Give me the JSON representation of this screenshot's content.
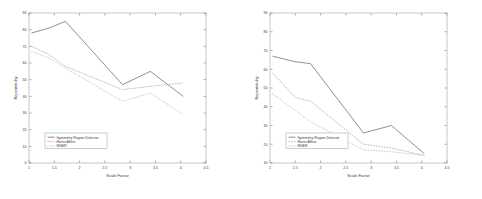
{
  "figure": {
    "background": "#ffffff",
    "panel_count": 2
  },
  "chart_data": [
    {
      "id": "left",
      "type": "line",
      "title": "",
      "xlabel": "Scale Factor",
      "ylabel": "Repeatability",
      "xlim": [
        1,
        4.5
      ],
      "ylim": [
        0,
        90
      ],
      "xticks": [
        1,
        1.5,
        2,
        2.5,
        3,
        3.5,
        4,
        4.5
      ],
      "xtick_labels": [
        "1",
        "1.5",
        "2",
        "2.5",
        "3",
        "3.5",
        "4",
        "4.5"
      ],
      "yticks": [
        0,
        10,
        20,
        30,
        40,
        50,
        60,
        70,
        80,
        90
      ],
      "ytick_labels": [
        "0",
        "10",
        "20",
        "30",
        "40",
        "50",
        "60",
        "70",
        "80",
        "90"
      ],
      "grid": false,
      "legend_position": "lower-left",
      "x": [
        1.05,
        1.4,
        1.72,
        2.85,
        3.4,
        4.05
      ],
      "series": [
        {
          "name": "Symmetry Region Detector",
          "style": "solid",
          "values": [
            78,
            81,
            85,
            47,
            55,
            40
          ]
        },
        {
          "name": "Harris Affine",
          "style": "dashed",
          "values": [
            70,
            65,
            58,
            44,
            46,
            48
          ]
        },
        {
          "name": "MSER",
          "style": "dotted",
          "values": [
            67,
            63,
            57,
            37,
            42,
            29
          ]
        }
      ]
    },
    {
      "id": "right",
      "type": "line",
      "title": "",
      "xlabel": "Scale Factor",
      "ylabel": "Repeatability",
      "xlim": [
        1,
        4.5
      ],
      "ylim": [
        10,
        90
      ],
      "xticks": [
        1,
        1.5,
        2,
        2.5,
        3,
        3.5,
        4,
        4.5
      ],
      "xtick_labels": [
        "1",
        "1.5",
        "2",
        "2.5",
        "3",
        "3.5",
        "4",
        "4.5"
      ],
      "yticks": [
        10,
        20,
        30,
        40,
        50,
        60,
        70,
        80,
        90
      ],
      "ytick_labels": [
        "10",
        "20",
        "30",
        "40",
        "50",
        "60",
        "70",
        "80",
        "90"
      ],
      "grid": false,
      "legend_position": "lower-left",
      "x": [
        1.05,
        1.5,
        1.8,
        2.85,
        3.4,
        4.05
      ],
      "series": [
        {
          "name": "Symmetry Region Detector",
          "style": "solid",
          "values": [
            67,
            64,
            63,
            26,
            30,
            15
          ]
        },
        {
          "name": "Harris Affine",
          "style": "dashed",
          "values": [
            58,
            45,
            43,
            20,
            18,
            14
          ]
        },
        {
          "name": "MSER",
          "style": "dotted",
          "values": [
            47,
            38,
            32,
            17,
            16,
            14
          ]
        }
      ]
    }
  ],
  "legend": {
    "entries": [
      "Symmetry Region Detector",
      "Harris Affine",
      "MSER"
    ]
  }
}
